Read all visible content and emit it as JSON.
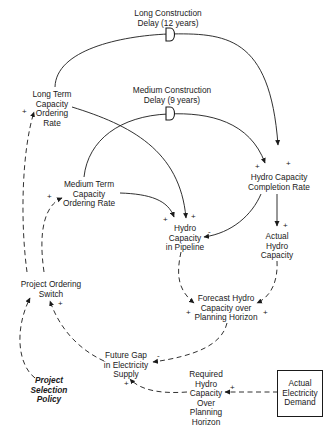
{
  "diagram": {
    "type": "causal-loop-diagram",
    "delays": [
      {
        "id": "long_delay",
        "label_line1": "Long Construction",
        "label_line2": "Delay (12 years)",
        "symbol": "D"
      },
      {
        "id": "medium_delay",
        "label_line1": "Medium Construction",
        "label_line2": "Delay (9 years)",
        "symbol": "D"
      }
    ],
    "nodes": {
      "long_term": {
        "l1": "Long Term",
        "l2": "Capacity",
        "l3": "Ordering",
        "l4": "Rate"
      },
      "medium_term": {
        "l1": "Medium Term",
        "l2": "Capacity",
        "l3": "Ordering Rate"
      },
      "pipeline": {
        "l1": "Hydro",
        "l2": "Capacity",
        "l3": "in Pipeline"
      },
      "completion": {
        "l1": "Hydro Capacity",
        "l2": "Completion Rate"
      },
      "actual_capacity": {
        "l1": "Actual",
        "l2": "Hydro",
        "l3": "Capacity"
      },
      "switch": {
        "l1": "Project Ordering",
        "l2": "Switch"
      },
      "forecast": {
        "l1": "Forecast Hydro",
        "l2": "Capacity over",
        "l3": "Planning Horizon"
      },
      "gap": {
        "l1": "Future Gap",
        "l2": "in Electricity",
        "l3": "Supply"
      },
      "policy": {
        "l1": "Project",
        "l2": "Selection",
        "l3": "Policy"
      },
      "required": {
        "l1": "Required",
        "l2": "Hydro",
        "l3": "Capacity",
        "l4": "Over",
        "l5": "Planning",
        "l6": "Horizon"
      },
      "demand": {
        "l1": "Actual",
        "l2": "Electricity",
        "l3": "Demand"
      }
    },
    "links": [
      {
        "from": "Long Term Capacity Ordering Rate",
        "to": "Hydro Capacity Completion Rate",
        "polarity": "+",
        "style": "solid",
        "delay": "Long Construction Delay (12 years)"
      },
      {
        "from": "Medium Term Capacity Ordering Rate",
        "to": "Hydro Capacity Completion Rate",
        "polarity": "+",
        "style": "solid",
        "delay": "Medium Construction Delay (9 years)"
      },
      {
        "from": "Long Term Capacity Ordering Rate",
        "to": "Hydro Capacity in Pipeline",
        "polarity": "+",
        "style": "solid"
      },
      {
        "from": "Medium Term Capacity Ordering Rate",
        "to": "Hydro Capacity in Pipeline",
        "polarity": "+",
        "style": "solid"
      },
      {
        "from": "Hydro Capacity Completion Rate",
        "to": "Hydro Capacity in Pipeline",
        "polarity": "-",
        "style": "solid"
      },
      {
        "from": "Hydro Capacity Completion Rate",
        "to": "Actual Hydro Capacity",
        "polarity": "+",
        "style": "solid"
      },
      {
        "from": "Hydro Capacity in Pipeline",
        "to": "Forecast Hydro Capacity over Planning Horizon",
        "polarity": "+",
        "style": "dashed"
      },
      {
        "from": "Actual Hydro Capacity",
        "to": "Forecast Hydro Capacity over Planning Horizon",
        "polarity": "+",
        "style": "dashed"
      },
      {
        "from": "Forecast Hydro Capacity over Planning Horizon",
        "to": "Future Gap in Electricity Supply",
        "polarity": "-",
        "style": "dashed"
      },
      {
        "from": "Required Hydro Capacity Over Planning Horizon",
        "to": "Future Gap in Electricity Supply",
        "polarity": "+",
        "style": "dashed"
      },
      {
        "from": "Actual Electricity Demand",
        "to": "Required Hydro Capacity Over Planning Horizon",
        "polarity": "+",
        "style": "dashed"
      },
      {
        "from": "Future Gap in Electricity Supply",
        "to": "Project Ordering Switch",
        "polarity": "+",
        "style": "dashed"
      },
      {
        "from": "Project Selection Policy",
        "to": "Project Ordering Switch",
        "polarity": "+",
        "style": "dashed"
      },
      {
        "from": "Project Ordering Switch",
        "to": "Long Term Capacity Ordering Rate",
        "polarity": "+",
        "style": "dashed"
      },
      {
        "from": "Project Ordering Switch",
        "to": "Medium Term Capacity Ordering Rate",
        "polarity": "+",
        "style": "dashed"
      }
    ],
    "polarity": {
      "plus": "+",
      "minus": "-"
    },
    "colors": {
      "ink": "#1a1a1a",
      "background": "#ffffff"
    }
  }
}
